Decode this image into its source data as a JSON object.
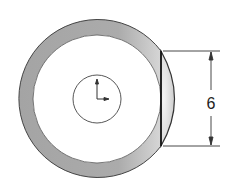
{
  "drawing": {
    "type": "cad-section-view",
    "description": "Circular ring with a flat chord cut on the right and a dimensioned segment",
    "colors": {
      "background": "#ffffff",
      "ring_fill": "#a9a9a9",
      "outline": "#333333",
      "segment_fill": "#e6e6e6"
    },
    "geometry": {
      "center": [
        97,
        99
      ],
      "outer_radius": 79,
      "inner_radius": 64,
      "hole_radius": 24,
      "chord_x": 161,
      "chord_top_y": 51,
      "chord_bottom_y": 146
    },
    "dimension": {
      "label": "6",
      "orientation": "vertical",
      "line_x": 211,
      "extension_end_x": 220
    },
    "origin_marker": {
      "label": "coordinate-axes",
      "x_axis": "right",
      "y_axis": "up"
    }
  }
}
